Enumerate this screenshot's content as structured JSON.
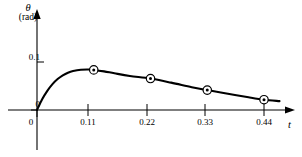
{
  "chart_data": {
    "type": "line",
    "title": "",
    "subtitle": "",
    "xlabel": "t",
    "ylabel": "θ",
    "ylabel_unit": "(rad)",
    "xlim": [
      0,
      0.5
    ],
    "ylim": [
      0,
      0.12
    ],
    "grid": false,
    "legend": null,
    "x_ticks": [
      {
        "value": 0,
        "label": "0"
      },
      {
        "value": 0.11,
        "label": "0.11"
      },
      {
        "value": 0.22,
        "label": "0.22"
      },
      {
        "value": 0.33,
        "label": "0.33"
      },
      {
        "value": 0.44,
        "label": "0.44"
      }
    ],
    "y_ticks": [
      {
        "value": 0,
        "label": "0"
      },
      {
        "value": 0.1,
        "label": "0.1"
      }
    ],
    "series": [
      {
        "name": "theta",
        "marker": "circled-dot",
        "line_color": "#000000",
        "marker_points": [
          {
            "x": 0.11,
            "y": 0.0835
          },
          {
            "x": 0.22,
            "y": 0.0655
          },
          {
            "x": 0.33,
            "y": 0.0415
          },
          {
            "x": 0.44,
            "y": 0.0215
          }
        ],
        "curve_points": [
          {
            "x": 0.0,
            "y": 0.0
          },
          {
            "x": 0.01,
            "y": 0.0225
          },
          {
            "x": 0.02,
            "y": 0.04
          },
          {
            "x": 0.03,
            "y": 0.054
          },
          {
            "x": 0.04,
            "y": 0.0645
          },
          {
            "x": 0.05,
            "y": 0.0722
          },
          {
            "x": 0.06,
            "y": 0.0778
          },
          {
            "x": 0.07,
            "y": 0.0812
          },
          {
            "x": 0.085,
            "y": 0.0838
          },
          {
            "x": 0.1,
            "y": 0.0843
          },
          {
            "x": 0.11,
            "y": 0.0835
          },
          {
            "x": 0.13,
            "y": 0.0805
          },
          {
            "x": 0.15,
            "y": 0.0765
          },
          {
            "x": 0.18,
            "y": 0.071
          },
          {
            "x": 0.22,
            "y": 0.0655
          },
          {
            "x": 0.26,
            "y": 0.057
          },
          {
            "x": 0.3,
            "y": 0.0475
          },
          {
            "x": 0.33,
            "y": 0.0415
          },
          {
            "x": 0.37,
            "y": 0.034
          },
          {
            "x": 0.41,
            "y": 0.0265
          },
          {
            "x": 0.44,
            "y": 0.0215
          },
          {
            "x": 0.47,
            "y": 0.0185
          }
        ]
      }
    ]
  },
  "axes": {
    "x_axis_name": "time-axis",
    "y_axis_name": "theta-axis",
    "axis_color": "#000000"
  }
}
